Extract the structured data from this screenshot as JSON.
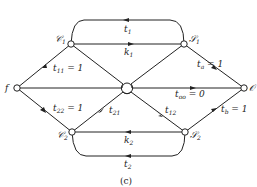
{
  "diagram": {
    "caption": "(c)",
    "nodes": {
      "f": "f",
      "c1": "𝒞",
      "c1_sub": "1",
      "c2": "𝒞",
      "c2_sub": "2",
      "s1": "𝒮",
      "s1_sub": "1",
      "s2": "𝒮",
      "s2_sub": "2",
      "o": "𝒪"
    },
    "edges": {
      "t11": "t",
      "t11_sub": "11",
      "t11_val": " = 1",
      "t22": "t",
      "t22_sub": "22",
      "t22_val": " = 1",
      "t21": "t",
      "t21_sub": "21",
      "t12": "t",
      "t12_sub": "12",
      "ta": "t",
      "ta_sub": "a",
      "ta_val": " = 1",
      "tb": "t",
      "tb_sub": "b",
      "tb_val": " = 1",
      "too": "t",
      "too_sub": "oo",
      "too_val": " = 0",
      "t1": "t",
      "t1_sub": "1",
      "k1": "k",
      "k1_sub": "1",
      "k2": "k",
      "k2_sub": "2",
      "t2": "t",
      "t2_sub": "2"
    }
  }
}
